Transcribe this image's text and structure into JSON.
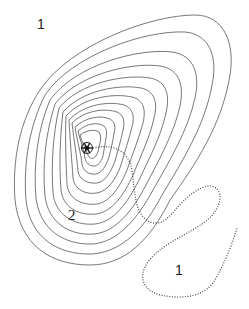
{
  "diagram": {
    "type": "contour-map",
    "colors": {
      "background": "#ffffff",
      "contour_stroke": "#555555",
      "dotted_stroke": "#444444",
      "label": "#222222"
    },
    "labels": {
      "top_left": "1",
      "inner": "2",
      "bottom_right": "1"
    },
    "center_symbol": "snowflake-icon",
    "contour_count": 12
  }
}
